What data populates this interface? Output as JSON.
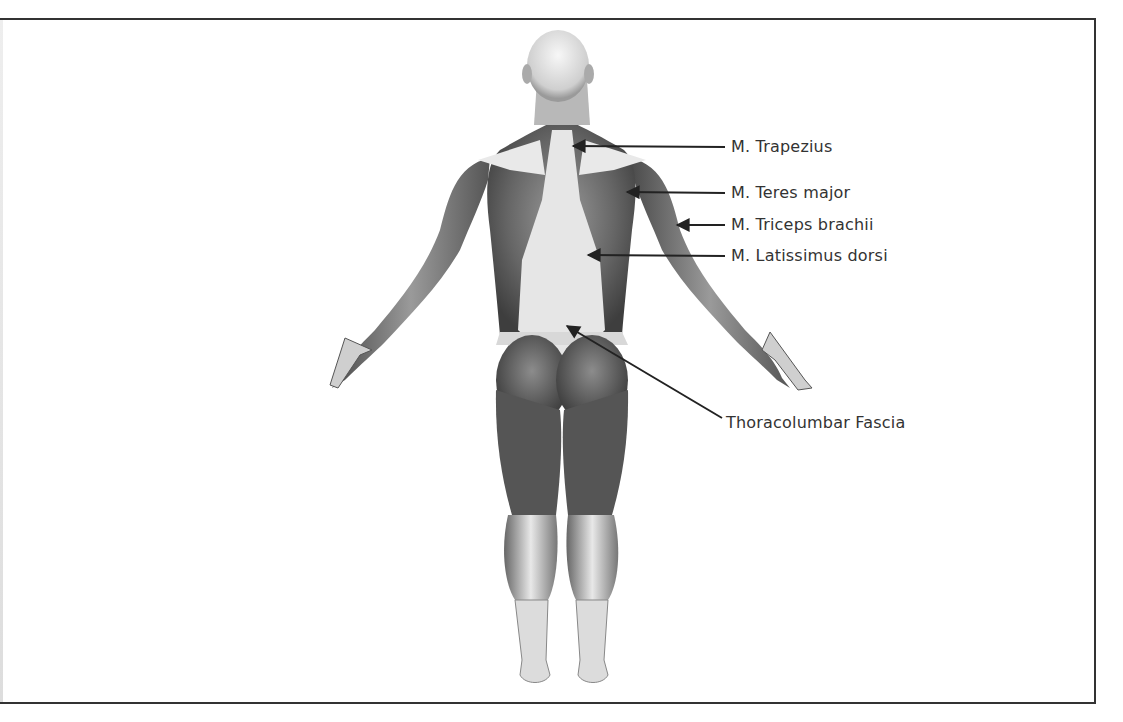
{
  "diagram": {
    "labels": [
      {
        "id": "trapezius",
        "text": "M. Trapezius",
        "x": 731,
        "y": 137,
        "arrow_from": [
          725,
          147
        ],
        "arrow_to": [
          573,
          146
        ]
      },
      {
        "id": "teres-major",
        "text": "M. Teres major",
        "x": 731,
        "y": 183,
        "arrow_from": [
          725,
          193
        ],
        "arrow_to": [
          627,
          192
        ]
      },
      {
        "id": "triceps-brachii",
        "text": "M. Triceps brachii",
        "x": 731,
        "y": 215,
        "arrow_from": [
          725,
          225
        ],
        "arrow_to": [
          677,
          225
        ]
      },
      {
        "id": "latissimus-dorsi",
        "text": "M. Latissimus dorsi",
        "x": 731,
        "y": 246,
        "arrow_from": [
          725,
          256
        ],
        "arrow_to": [
          588,
          255
        ]
      },
      {
        "id": "thoracolumbar-fascia",
        "text": "Thoracolumbar Fascia",
        "x": 726,
        "y": 413,
        "arrow_from": [
          722,
          418
        ],
        "arrow_to": [
          567,
          326
        ]
      }
    ],
    "colors": {
      "border": "#333333",
      "text": "#333333",
      "arrow": "#222222",
      "skin_light": "#f2f2f2",
      "muscle_dark": "#5a5a5a"
    }
  }
}
